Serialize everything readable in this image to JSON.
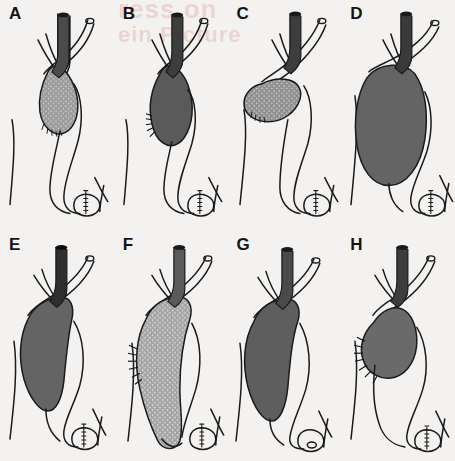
{
  "figure": {
    "background_color": "#f4f2f0",
    "ink_color": "#1a1a1a",
    "bleed_through": {
      "line_1": "ress on",
      "line_2": "ein Picture"
    },
    "panel_count": 8,
    "columns": 4,
    "rows": 2
  },
  "panels": [
    {
      "label": "A",
      "fill_color": "#9a9a9a",
      "texture": "speckled-light",
      "gallbladder_size": "small",
      "gallbladder_shape": "pear-shaped-vertical",
      "fundus_hatching": true,
      "hatching_side": "bottom",
      "duct_fill": "#4a4a4a",
      "duodenum_hatching": true
    },
    {
      "label": "B",
      "fill_color": "#5a5a5a",
      "texture": "solid-dark",
      "gallbladder_size": "small-medium",
      "gallbladder_shape": "elongated-vertical",
      "fundus_hatching": true,
      "hatching_side": "left",
      "duct_fill": "#3d3d3d",
      "duodenum_hatching": true
    },
    {
      "label": "C",
      "fill_color": "#8e8e8e",
      "texture": "speckled-medium",
      "gallbladder_size": "small",
      "gallbladder_shape": "horizontal-sac",
      "fundus_hatching": true,
      "hatching_side": "bottom-left",
      "duct_fill": "#3d3d3d",
      "duodenum_hatching": true
    },
    {
      "label": "D",
      "fill_color": "#646464",
      "texture": "solid-dark",
      "gallbladder_size": "large",
      "gallbladder_shape": "broad-distended",
      "fundus_hatching": false,
      "hatching_side": "none",
      "duct_fill": "#3a3a3a",
      "duodenum_hatching": true
    },
    {
      "label": "E",
      "fill_color": "#646464",
      "texture": "solid-dark",
      "gallbladder_size": "large",
      "gallbladder_shape": "sigmoid-elongated",
      "fundus_hatching": false,
      "hatching_side": "none",
      "duct_fill": "#2f2f2f",
      "duodenum_hatching": true
    },
    {
      "label": "F",
      "fill_color": "#a2a2a2",
      "texture": "speckled-light",
      "gallbladder_size": "very-large",
      "gallbladder_shape": "sigmoid-descending",
      "fundus_hatching": true,
      "hatching_side": "upper-left",
      "duct_fill": "#5a5a5a",
      "duodenum_hatching": true
    },
    {
      "label": "G",
      "fill_color": "#5e5e5e",
      "texture": "solid-dark",
      "gallbladder_size": "large",
      "gallbladder_shape": "sigmoid-elongated",
      "fundus_hatching": false,
      "hatching_side": "none",
      "duct_fill": "#4a4a4a",
      "duodenum_hatching": false
    },
    {
      "label": "H",
      "fill_color": "#6a6a6a",
      "texture": "solid-dark",
      "gallbladder_size": "medium",
      "gallbladder_shape": "oblique-tapered",
      "fundus_hatching": true,
      "hatching_side": "left",
      "duct_fill": "#3d3d3d",
      "duodenum_hatching": true
    }
  ]
}
